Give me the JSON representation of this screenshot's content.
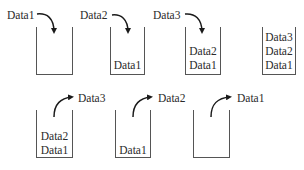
{
  "diagram": {
    "type": "stack push/pop illustration",
    "push_row": [
      {
        "incoming": "Data1",
        "contents": []
      },
      {
        "incoming": "Data2",
        "contents": [
          "Data1"
        ]
      },
      {
        "incoming": "Data3",
        "contents": [
          "Data2",
          "Data1"
        ]
      },
      {
        "incoming": null,
        "contents": [
          "Data3",
          "Data2",
          "Data1"
        ]
      }
    ],
    "pop_row": [
      {
        "outgoing": "Data3",
        "contents": [
          "Data2",
          "Data1"
        ]
      },
      {
        "outgoing": "Data2",
        "contents": [
          "Data1"
        ]
      },
      {
        "outgoing": "Data1",
        "contents": []
      }
    ]
  },
  "labels": {
    "p1": "Data1",
    "p2": "Data2",
    "p3": "Data3",
    "s2_1": "Data1",
    "s3_1": "Data2",
    "s3_2": "Data1",
    "s4_1": "Data3",
    "s4_2": "Data2",
    "s4_3": "Data1",
    "o1": "Data3",
    "o2": "Data2",
    "o3": "Data1",
    "b1_1": "Data2",
    "b1_2": "Data1",
    "b2_1": "Data1"
  },
  "colors": {
    "line": "#555555",
    "arrow": "#1a1a1a",
    "text": "#2a2a2a"
  }
}
